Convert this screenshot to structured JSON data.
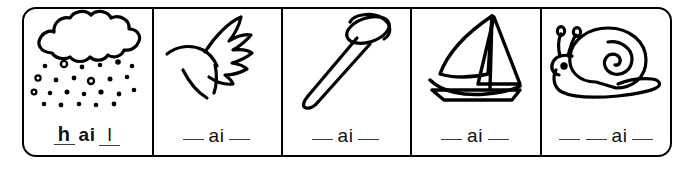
{
  "worksheet": {
    "title": "ai phonics picture cards",
    "phoneme": "ai",
    "frame_color": "#000000",
    "text_color": "#111111",
    "blank_color": "#3a3a3a",
    "cells": [
      {
        "id": "cell-hail",
        "picture": "hail-cloud-icon",
        "picture_label": "hail",
        "answer": "hail",
        "filled": true,
        "prefix_letter": "h",
        "suffix_letter": "l",
        "phoneme": "ai",
        "phoneme_bold": true,
        "blanks_before": 0,
        "blanks_after": 0,
        "text": "h ai l"
      },
      {
        "id": "cell-wing",
        "picture": "wing-icon",
        "picture_label": "wing",
        "answer": "",
        "filled": false,
        "prefix_letter": "",
        "suffix_letter": "",
        "phoneme": "ai",
        "phoneme_bold": false,
        "blanks_before": 1,
        "blanks_after": 1,
        "text": "__ ai __"
      },
      {
        "id": "cell-nail",
        "picture": "nail-icon",
        "picture_label": "nail",
        "answer": "",
        "filled": false,
        "prefix_letter": "",
        "suffix_letter": "",
        "phoneme": "ai",
        "phoneme_bold": false,
        "blanks_before": 1,
        "blanks_after": 1,
        "text": "__ ai __"
      },
      {
        "id": "cell-sail",
        "picture": "sailboat-icon",
        "picture_label": "sail",
        "answer": "",
        "filled": false,
        "prefix_letter": "",
        "suffix_letter": "",
        "phoneme": "ai",
        "phoneme_bold": false,
        "blanks_before": 1,
        "blanks_after": 1,
        "text": "__ ai __"
      },
      {
        "id": "cell-snail",
        "picture": "snail-icon",
        "picture_label": "snail",
        "answer": "",
        "filled": false,
        "prefix_letter": "",
        "suffix_letter": "",
        "phoneme": "ai",
        "phoneme_bold": false,
        "blanks_before": 2,
        "blanks_after": 1,
        "text": "__ __ ai __"
      }
    ]
  }
}
